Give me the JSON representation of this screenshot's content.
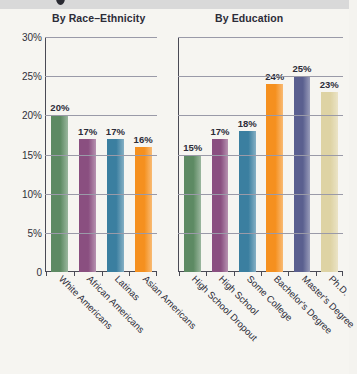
{
  "chart_data": {
    "type": "bar",
    "title": "",
    "xlabel": "",
    "ylabel": "",
    "ylim": [
      0,
      30
    ],
    "grid": true,
    "legend_position": "none",
    "yticks": [
      "0",
      "5%",
      "10%",
      "15%",
      "20%",
      "25%",
      "30%"
    ],
    "ytick_values": [
      0,
      5,
      10,
      15,
      20,
      25,
      30
    ],
    "panels": [
      {
        "title": "By Race–Ethnicity",
        "categories": [
          "White Americans",
          "African Americans",
          "Latinas",
          "Asian Americans"
        ],
        "values": [
          20,
          17,
          17,
          16
        ],
        "value_labels": [
          "20%",
          "17%",
          "17%",
          "16%"
        ],
        "colors": [
          "#5d8a63",
          "#8a4f80",
          "#3b7fa0",
          "#f5901f"
        ]
      },
      {
        "title": "By Education",
        "categories": [
          "High School Dropout",
          "High School",
          "Some College",
          "Bachelor's Degree",
          "Master's Degree",
          "Ph.D."
        ],
        "values": [
          15,
          17,
          18,
          24,
          25,
          23
        ],
        "value_labels": [
          "15%",
          "17%",
          "18%",
          "24%",
          "25%",
          "23%"
        ],
        "colors": [
          "#5d8a63",
          "#8a4f80",
          "#3b7fa0",
          "#f5901f",
          "#5a5f8f",
          "#ded3a4"
        ]
      }
    ]
  }
}
